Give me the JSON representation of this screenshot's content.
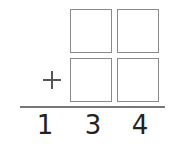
{
  "problem": {
    "operator": "+",
    "answer_digits": [
      "1",
      "3",
      "4"
    ],
    "boxes": {
      "top_row": [
        "",
        ""
      ],
      "bottom_row": [
        "",
        ""
      ]
    }
  }
}
